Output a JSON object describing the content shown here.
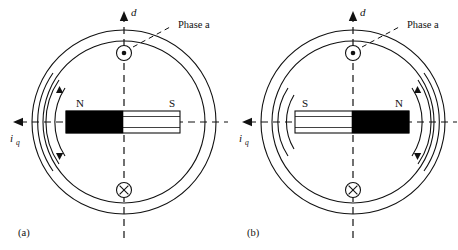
{
  "figure": {
    "background_color": "#ffffff",
    "line_color": "#111111",
    "magnet_north_fill": "#000000",
    "magnet_south_fill": "#ffffff"
  },
  "panels": [
    {
      "id": "panel-a",
      "caption": "(a)",
      "axis_d_label": "d",
      "axis_q_label": "i",
      "axis_q_sub": "q",
      "phase_label": "Phase a",
      "pole_left": "N",
      "pole_right": "S",
      "north_side": "left",
      "flux_side": "left",
      "conductor_top_symbol": "dot",
      "conductor_bottom_symbol": "cross"
    },
    {
      "id": "panel-b",
      "caption": "(b)",
      "axis_d_label": "d",
      "axis_q_label": "i",
      "axis_q_sub": "q",
      "phase_label": "Phase a",
      "pole_left": "S",
      "pole_right": "N",
      "north_side": "right",
      "flux_side": "right",
      "conductor_top_symbol": "dot",
      "conductor_bottom_symbol": "cross"
    }
  ]
}
